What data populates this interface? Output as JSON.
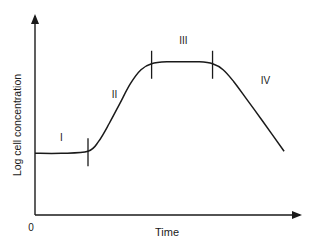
{
  "chart_data": {
    "type": "line",
    "title": "",
    "xlabel": "Time",
    "ylabel": "Log cell concentration",
    "origin_label": "0",
    "x_ticks": [],
    "y_ticks": [],
    "grid": false,
    "legend": "none",
    "xlim": [
      0,
      100
    ],
    "ylim": [
      0,
      100
    ],
    "phase_boundaries_x": [
      20,
      44,
      67
    ],
    "phases": [
      {
        "label": "I",
        "name": "lag",
        "x": 10,
        "y": 37
      },
      {
        "label": "II",
        "name": "exponential",
        "x": 30,
        "y": 59
      },
      {
        "label": "III",
        "name": "stationary",
        "x": 56,
        "y": 86
      },
      {
        "label": "IV",
        "name": "death",
        "x": 87,
        "y": 66
      }
    ],
    "series": [
      {
        "name": "growth curve",
        "points": [
          [
            0,
            31
          ],
          [
            10,
            31
          ],
          [
            20,
            32
          ],
          [
            24,
            37
          ],
          [
            28,
            46
          ],
          [
            32,
            56
          ],
          [
            36,
            66
          ],
          [
            40,
            73
          ],
          [
            44,
            76
          ],
          [
            50,
            77
          ],
          [
            56,
            77
          ],
          [
            62,
            77
          ],
          [
            67,
            76
          ],
          [
            71,
            73
          ],
          [
            75,
            67
          ],
          [
            80,
            58
          ],
          [
            86,
            47
          ],
          [
            94,
            32
          ]
        ]
      }
    ]
  }
}
